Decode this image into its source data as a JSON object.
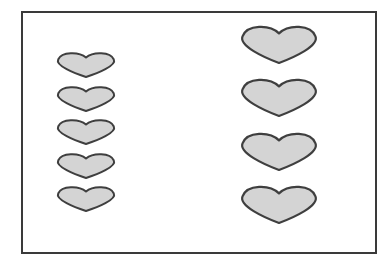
{
  "figure": {
    "frame": {
      "x": 21,
      "y": 11,
      "width": 354,
      "height": 241,
      "stroke": "#3a3a3a"
    },
    "heart_style": {
      "fill": "#d4d4d4",
      "stroke": "#3f3f3f"
    },
    "columns": [
      {
        "name": "left",
        "count": 5,
        "size": "small",
        "hearts": [
          {
            "x": 57,
            "y": 52,
            "w": 58,
            "h": 25
          },
          {
            "x": 57,
            "y": 86,
            "w": 58,
            "h": 25
          },
          {
            "x": 57,
            "y": 119,
            "w": 58,
            "h": 25
          },
          {
            "x": 57,
            "y": 153,
            "w": 58,
            "h": 25
          },
          {
            "x": 57,
            "y": 186,
            "w": 58,
            "h": 25
          }
        ]
      },
      {
        "name": "right",
        "count": 4,
        "size": "large",
        "hearts": [
          {
            "x": 241,
            "y": 25,
            "w": 76,
            "h": 38
          },
          {
            "x": 241,
            "y": 78,
            "w": 76,
            "h": 38
          },
          {
            "x": 241,
            "y": 132,
            "w": 76,
            "h": 38
          },
          {
            "x": 241,
            "y": 185,
            "w": 76,
            "h": 38
          }
        ]
      }
    ]
  }
}
